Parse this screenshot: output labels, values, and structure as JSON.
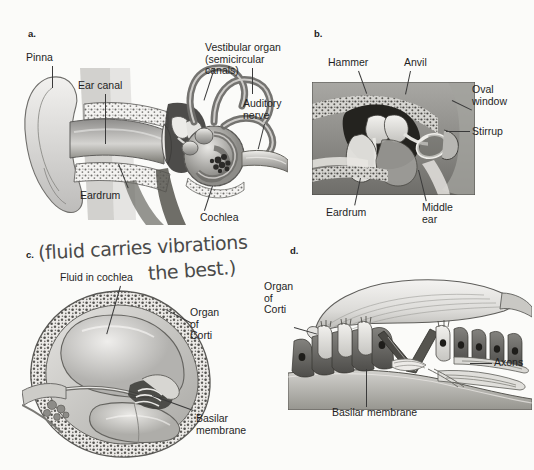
{
  "figure": {
    "background_color": "#fbfbf9",
    "text_color": "#1f1f1f",
    "panels": [
      {
        "id": "a",
        "label": "a.",
        "caption_subject": "outer, middle and inner ear overview",
        "labels": [
          {
            "name": "pinna",
            "text": "Pinna"
          },
          {
            "name": "ear-canal",
            "text": "Ear canal"
          },
          {
            "name": "eardrum",
            "text": "Eardrum"
          },
          {
            "name": "vestibular-organ",
            "text": "Vestibular organ\n(semicircular canals)"
          },
          {
            "name": "auditory-nerve",
            "text": "Auditory\nnerve"
          },
          {
            "name": "cochlea",
            "text": "Cochlea"
          }
        ]
      },
      {
        "id": "b",
        "label": "b.",
        "caption_subject": "middle ear ossicles photograph",
        "labels": [
          {
            "name": "hammer",
            "text": "Hammer"
          },
          {
            "name": "anvil",
            "text": "Anvil"
          },
          {
            "name": "oval-window",
            "text": "Oval\nwindow"
          },
          {
            "name": "stirrup",
            "text": "Stirrup"
          },
          {
            "name": "eardrum",
            "text": "Eardrum"
          },
          {
            "name": "middle-ear",
            "text": "Middle\near"
          }
        ]
      },
      {
        "id": "c",
        "label": "c.",
        "caption_subject": "cochlea cross section",
        "labels": [
          {
            "name": "fluid-in-cochlea",
            "text": "Fluid in cochlea"
          },
          {
            "name": "organ-of-corti",
            "text": "Organ\nof\nCorti"
          },
          {
            "name": "basilar-membrane",
            "text": "Basilar\nmembrane"
          }
        ]
      },
      {
        "id": "d",
        "label": "d.",
        "caption_subject": "organ of Corti detail",
        "labels": [
          {
            "name": "organ-of-corti",
            "text": "Organ\nof\nCorti"
          },
          {
            "name": "axons",
            "text": "Axons"
          },
          {
            "name": "basilar-membrane",
            "text": "Basilar membrane"
          }
        ]
      }
    ],
    "annotation": {
      "name": "handwritten-note",
      "line1": "(fluid carries vibrations",
      "line2": "the best.)",
      "color": "#3b3b3b",
      "style": "handwritten marker"
    }
  }
}
